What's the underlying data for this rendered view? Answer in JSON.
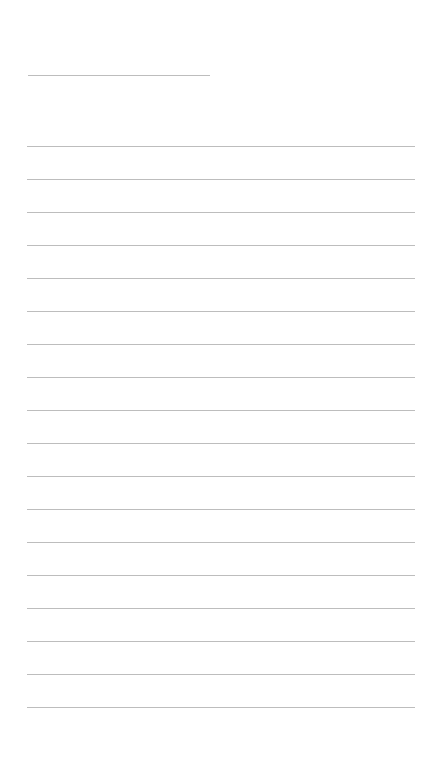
{
  "page": {
    "type": "lined-paper",
    "background": "#ffffff",
    "rule_color": "#bdbdbd",
    "title_line": {
      "present": true
    },
    "ruled_lines": {
      "count": 18,
      "spacing_px": 33
    }
  }
}
